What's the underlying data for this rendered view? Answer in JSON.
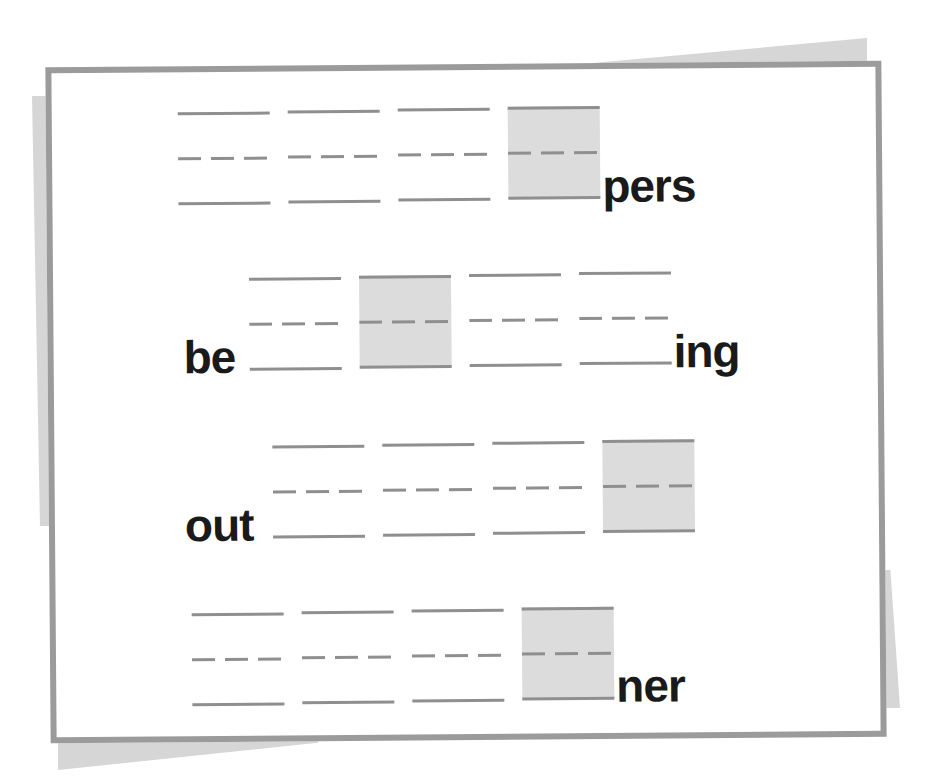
{
  "worksheet": {
    "title": "",
    "colors": {
      "frame_border": "#9b9b9b",
      "back_card": "#d6d6d6",
      "guide_lines": "#8f8f8f",
      "shaded_box": "#dcdcdc",
      "text": "#1a1a1a"
    },
    "rows": [
      {
        "prefix": "",
        "suffix": "pers",
        "slot_count": 4,
        "shaded_slot_index": 3
      },
      {
        "prefix": "be",
        "suffix": "ing",
        "slot_count": 4,
        "shaded_slot_index": 1
      },
      {
        "prefix": "out",
        "suffix": "",
        "slot_count": 4,
        "shaded_slot_index": 3
      },
      {
        "prefix": "",
        "suffix": "ner",
        "slot_count": 4,
        "shaded_slot_index": 3
      }
    ]
  }
}
